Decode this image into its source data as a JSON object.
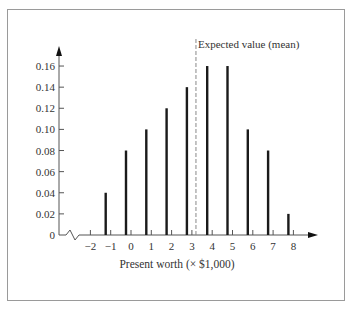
{
  "chart_data": {
    "type": "bar",
    "title": "",
    "xlabel": "Present worth (× $1,000)",
    "ylabel": "",
    "x_ticks": [
      "−2",
      "−1",
      "0",
      "1",
      "2",
      "3",
      "4",
      "5",
      "6",
      "7",
      "8"
    ],
    "x_tick_values": [
      -2,
      -1,
      0,
      1,
      2,
      3,
      4,
      5,
      6,
      7,
      8
    ],
    "y_ticks": [
      "0",
      "0.02",
      "0.04",
      "0.06",
      "0.08",
      "0.10",
      "0.12",
      "0.14",
      "0.16"
    ],
    "y_tick_values": [
      0,
      0.02,
      0.04,
      0.06,
      0.08,
      0.1,
      0.12,
      0.14,
      0.16
    ],
    "categories": [
      -1,
      0,
      1,
      2,
      3,
      4,
      5,
      6,
      7,
      8
    ],
    "values": [
      0.04,
      0.08,
      0.1,
      0.12,
      0.14,
      0.16,
      0.16,
      0.1,
      0.08,
      0.02
    ],
    "ylim": [
      0,
      0.17
    ],
    "xlim": [
      -2.5,
      9
    ],
    "grid": false,
    "axis_break": "x-axis broken between origin and −2",
    "annotations": [
      {
        "text": "Expected value (mean)",
        "x": 3.2,
        "style": "dashed vertical line"
      }
    ],
    "bar_offset_note": "bars drawn slightly left of each integer tick"
  },
  "colors": {
    "bar": "#1a1a1a",
    "axis": "#555555",
    "mean_line": "#888888",
    "frame": "#9a9a9a"
  }
}
